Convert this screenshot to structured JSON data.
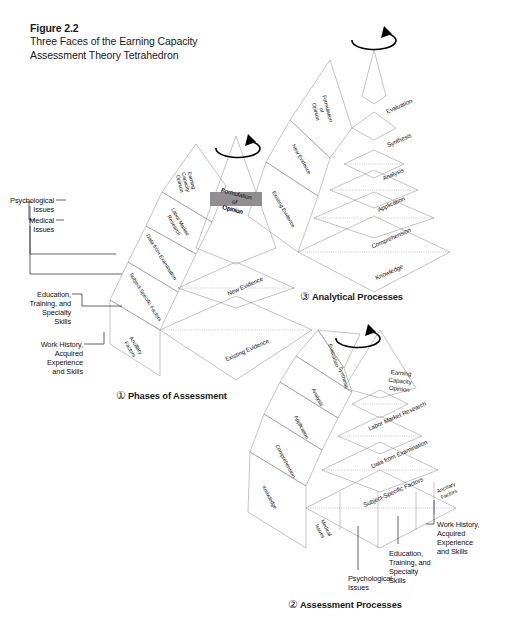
{
  "figure": {
    "number": "Figure 2.2",
    "title_line1": "Three Faces of the Earning Capacity",
    "title_line2": "Assessment Theory Tetrahedron"
  },
  "colors": {
    "apex_dark": "#8f8f8f",
    "apex_darker": "#7d7d7d",
    "tier_white": "#fbfbfb",
    "tier_light": "#e8e8e8",
    "tier_mid": "#d2d2d2",
    "tier_side": "#dcdcdc",
    "tier_side_light": "#efefef",
    "edge": "#8b8b8b",
    "text": "#111111"
  },
  "panels": [
    {
      "id": "phases-of-assessment",
      "marker": "①",
      "caption": "Phases of Assessment",
      "front_face_levels": [
        {
          "label": "Formulation\nof\nOpinion",
          "tone": "apex"
        },
        {
          "label": "New Evidence",
          "tone": "white"
        },
        {
          "label": "Existing Evidence",
          "tone": "mid"
        }
      ],
      "side_face_levels": [
        {
          "label": "Earning\nCapacity\nOpinion",
          "tone": "apex"
        },
        {
          "label": "Labor Market\nResearch",
          "tone": "white"
        },
        {
          "label": "Data from Examination",
          "tone": "white"
        },
        {
          "label": "Subject-Specific Factors",
          "tone": "light"
        },
        {
          "label": "Ancillary\nFactors",
          "tone": "mid"
        }
      ],
      "callouts": [
        {
          "lines": [
            "Psychological",
            "Issues"
          ]
        },
        {
          "lines": [
            "Medical",
            "Issues"
          ]
        },
        {
          "lines": [
            "Education,",
            "Training, and",
            "Specialty",
            "Skills"
          ]
        },
        {
          "lines": [
            "Work History,",
            "Acquired",
            "Experience",
            "and Skills"
          ]
        }
      ]
    },
    {
      "id": "analytical-processes",
      "marker": "③",
      "caption": "Analytical Processes",
      "front_face_levels": [
        {
          "label": "Evaluation",
          "tone": "apex"
        },
        {
          "label": "Synthesis",
          "tone": "apex"
        },
        {
          "label": "Analysis",
          "tone": "white"
        },
        {
          "label": "Application",
          "tone": "light"
        },
        {
          "label": "Comprehension",
          "tone": "mid"
        },
        {
          "label": "Knowledge",
          "tone": "mid"
        }
      ],
      "side_face_levels": [
        {
          "label": "Formulation\nof\nOpinion",
          "tone": "apex"
        },
        {
          "label": "New Evidence",
          "tone": "white"
        },
        {
          "label": "Existing Evidence",
          "tone": "light"
        }
      ],
      "callouts": []
    },
    {
      "id": "assessment-processes",
      "marker": "②",
      "caption": "Assessment Processes",
      "front_face_levels": [
        {
          "label": "Earning\nCapacity\nOpinion",
          "tone": "apex"
        },
        {
          "label": "Labor Market Research",
          "tone": "white"
        },
        {
          "label": "Data from Examination",
          "tone": "white"
        },
        {
          "label": "Subject-Specific Factors",
          "tone": "mid"
        },
        {
          "label": "Ancillary\nFactors",
          "tone": "mid"
        }
      ],
      "side_face_levels": [
        {
          "label": "Evaluation",
          "tone": "apex"
        },
        {
          "label": "Synthesis",
          "tone": "apex"
        },
        {
          "label": "Analysis",
          "tone": "white"
        },
        {
          "label": "Application",
          "tone": "white"
        },
        {
          "label": "Comprehension",
          "tone": "light"
        },
        {
          "label": "Knowledge",
          "tone": "light"
        }
      ],
      "base_segments": [
        {
          "label": "Medical\nIssues"
        },
        {
          "label": "Psychological\nIssues"
        },
        {
          "label": "Education,\nTraining, and\nSpecialty\nSkills"
        },
        {
          "label": "Work History,\nAcquired\nExperience\nand Skills"
        }
      ],
      "callouts": [
        {
          "lines": [
            "Psychological",
            "Issues"
          ]
        },
        {
          "lines": [
            "Education,",
            "Training, and",
            "Specialty",
            "Skills"
          ]
        },
        {
          "lines": [
            "Work History,",
            "Acquired",
            "Experience",
            "and Skills"
          ]
        }
      ]
    }
  ],
  "rotation_icon": "rotation-arrow-icon"
}
